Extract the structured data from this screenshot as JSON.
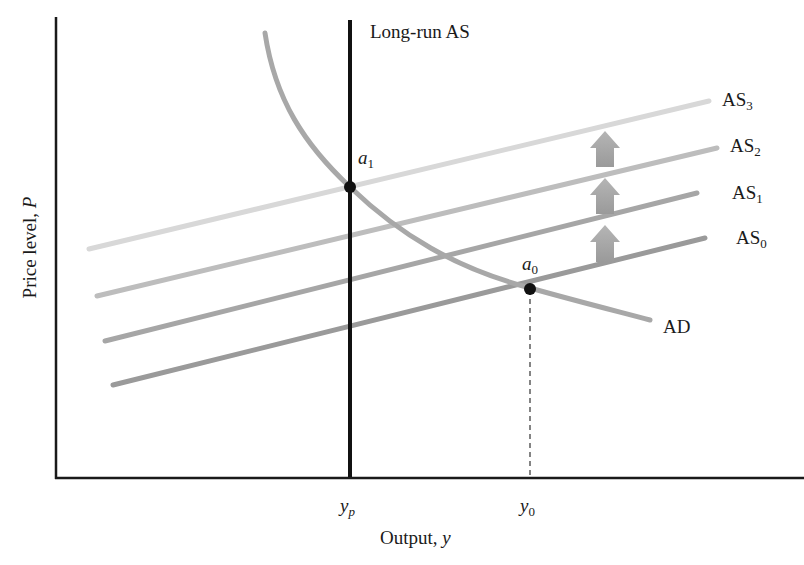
{
  "diagram": {
    "type": "AD-AS model",
    "axes": {
      "x_label": "Output,",
      "x_var": "y",
      "y_label": "Price level,",
      "y_var": "P",
      "x_ticks": [
        {
          "base": "y",
          "sub": "p"
        },
        {
          "base": "y",
          "sub": "0"
        }
      ]
    },
    "curves": {
      "lras": "Long-run AS",
      "ad": "AD",
      "as": [
        {
          "base": "AS",
          "sub": "0"
        },
        {
          "base": "AS",
          "sub": "1"
        },
        {
          "base": "AS",
          "sub": "2"
        },
        {
          "base": "AS",
          "sub": "3"
        }
      ]
    },
    "points": [
      {
        "base": "a",
        "sub": "1"
      },
      {
        "base": "a",
        "sub": "0"
      }
    ],
    "colors": {
      "axis": "#1a1a1a",
      "lras": "#111111",
      "ad": "#a8a8a8",
      "as0": "#9a9a9a",
      "as1": "#a6a6a6",
      "as2": "#bdbdbd",
      "as3": "#d8d8d8",
      "arrow": "#a0a0a0"
    }
  }
}
